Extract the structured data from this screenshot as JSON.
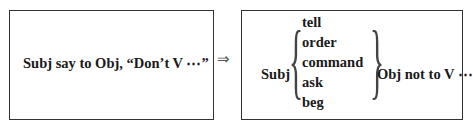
{
  "left_box": {
    "text": "Subj say to Obj, “Don’t  V ⋯”"
  },
  "arrow": "⇒",
  "right_box": {
    "subject": "Subj",
    "verbs": [
      "tell",
      "order",
      "command",
      "ask",
      "beg"
    ],
    "left_brace": "{",
    "right_brace": "}",
    "tail": "Obj not to V ⋯"
  }
}
